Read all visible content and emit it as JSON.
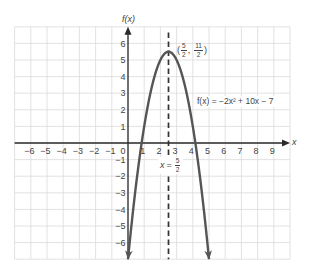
{
  "chart_data": {
    "type": "line",
    "title": "",
    "xlabel": "x",
    "ylabel": "f(x)",
    "xlim": [
      -7,
      10
    ],
    "ylim": [
      -7,
      7
    ],
    "grid": true,
    "legend": "none",
    "x_ticks": [
      -6,
      -5,
      -4,
      -3,
      -2,
      -1,
      0,
      1,
      2,
      3,
      4,
      5,
      6,
      7,
      8,
      9
    ],
    "x_tick_labels": [
      "−6",
      "−5",
      "−4",
      "−3",
      "−2",
      "−1",
      "0",
      "1",
      "2",
      "3",
      "4",
      "5",
      "6",
      "7",
      "8",
      "9"
    ],
    "y_ticks": [
      -6,
      -5,
      -4,
      -3,
      -2,
      -1,
      1,
      2,
      3,
      4,
      5,
      6
    ],
    "y_tick_labels": [
      "−6",
      "−5",
      "−4",
      "−3",
      "−2",
      "−1",
      "1",
      "2",
      "3",
      "4",
      "5",
      "6"
    ],
    "series": [
      {
        "name": "f(x) = −2x² + 10x − 7",
        "coefficients": {
          "a": -2,
          "b": 10,
          "c": -7
        },
        "domain_drawn": [
          0,
          5
        ],
        "x": [
          0,
          0.5,
          1,
          1.5,
          2,
          2.5,
          3,
          3.5,
          4,
          4.5,
          5
        ],
        "y": [
          -7,
          -2.5,
          1,
          3.5,
          5,
          5.5,
          5,
          3.5,
          1,
          -2.5,
          -7
        ],
        "end_arrows": true
      }
    ],
    "vertex": {
      "x": 2.5,
      "y": 5.5,
      "label": "(5/2, 11/2)"
    },
    "axis_of_symmetry": {
      "x": 2.5,
      "label": "x = 5/2",
      "style": "dashed",
      "top_y": 6.65
    },
    "annotations": [
      {
        "text": "(5/2, 11/2)",
        "near": "vertex"
      },
      {
        "text": "f(x) = −2x² + 10x − 7",
        "near": "right branch, y≈2.5"
      },
      {
        "text": "x = 5/2",
        "near": "axis of symmetry, below x-axis"
      }
    ],
    "colors": {
      "curve": "#555555",
      "axes": "#2b2b2b",
      "grid": "#dadada",
      "dashed_line": "#333333",
      "text": "#444444"
    }
  },
  "labels": {
    "y_axis": "f(x)",
    "x_axis": "x",
    "vertex": {
      "open": "(",
      "x_num": "5",
      "x_den": "2",
      "sep": ",",
      "y_num": "11",
      "y_den": "2",
      "close": ")"
    },
    "equation": "f(x) = −2x² + 10x − 7",
    "symmetry": {
      "var": "x",
      "eq": "=",
      "num": "5",
      "den": "2"
    }
  }
}
